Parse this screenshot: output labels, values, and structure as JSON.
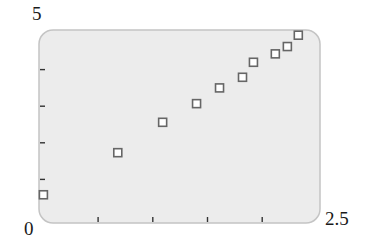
{
  "chart_data": {
    "type": "scatter",
    "title": "",
    "xlabel": "",
    "ylabel": "",
    "xlim": [
      0,
      2.5
    ],
    "ylim": [
      0,
      5
    ],
    "x_tick_labels": [
      "0",
      "2.5"
    ],
    "y_tick_labels": [
      "5"
    ],
    "x_ticks": [
      0.5,
      1.0,
      1.5,
      2.0
    ],
    "y_ticks": [
      1,
      2,
      3,
      4
    ],
    "grid": false,
    "legend": null,
    "marker": "open-square",
    "series": [
      {
        "name": "data",
        "x": [
          0.0,
          0.68,
          1.09,
          1.4,
          1.61,
          1.82,
          1.92,
          2.12,
          2.23,
          2.33
        ],
        "y": [
          0.58,
          1.73,
          2.56,
          3.07,
          3.5,
          3.79,
          4.2,
          4.43,
          4.63,
          4.94
        ]
      }
    ]
  },
  "labels": {
    "y_max": "5",
    "origin": "0",
    "x_max": "2.5"
  },
  "colors": {
    "plot_background": "#ececec",
    "plot_border": "#c4c4c4",
    "marker_stroke": "#666666",
    "marker_fill": "#ffffff",
    "tick": "#333333"
  }
}
